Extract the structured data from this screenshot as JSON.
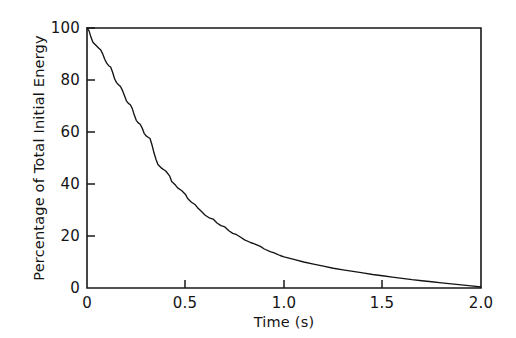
{
  "chart_data": {
    "type": "line",
    "title": "",
    "xlabel": "Time (s)",
    "ylabel": "Percentage of Total Initial Energy",
    "xlim": [
      0,
      2.0
    ],
    "ylim": [
      0,
      100
    ],
    "xticks": [
      "0",
      "0.5",
      "1.0",
      "1.5",
      "2.0"
    ],
    "xtick_values": [
      0,
      0.5,
      1.0,
      1.5,
      2.0
    ],
    "yticks": [
      "0",
      "20",
      "40",
      "60",
      "80",
      "100"
    ],
    "ytick_values": [
      0,
      20,
      40,
      60,
      80,
      100
    ],
    "grid": false,
    "legend": false,
    "legend_position": "none",
    "line_color": "#141414",
    "series": [
      {
        "name": "Percentage of total initial energy",
        "x": [
          0.0,
          0.01,
          0.02,
          0.03,
          0.05,
          0.06,
          0.07,
          0.08,
          0.09,
          0.1,
          0.11,
          0.12,
          0.13,
          0.14,
          0.15,
          0.16,
          0.17,
          0.18,
          0.19,
          0.2,
          0.21,
          0.22,
          0.23,
          0.24,
          0.25,
          0.26,
          0.27,
          0.28,
          0.29,
          0.3,
          0.31,
          0.32,
          0.33,
          0.34,
          0.35,
          0.36,
          0.38,
          0.39,
          0.4,
          0.42,
          0.43,
          0.45,
          0.46,
          0.48,
          0.5,
          0.51,
          0.53,
          0.55,
          0.56,
          0.58,
          0.6,
          0.62,
          0.64,
          0.66,
          0.68,
          0.7,
          0.72,
          0.74,
          0.76,
          0.78,
          0.8,
          0.83,
          0.85,
          0.88,
          0.9,
          0.93,
          0.95,
          0.98,
          1.0,
          1.05,
          1.1,
          1.15,
          1.2,
          1.25,
          1.3,
          1.35,
          1.4,
          1.45,
          1.5,
          1.55,
          1.6,
          1.65,
          1.7,
          1.75,
          1.8,
          1.85,
          1.9,
          1.95,
          2.0
        ],
        "y": [
          100.0,
          99.0,
          96.5,
          94.5,
          93.0,
          92.2,
          91.5,
          90.0,
          88.0,
          86.5,
          85.5,
          85.0,
          83.0,
          80.5,
          79.0,
          78.2,
          77.5,
          76.0,
          74.0,
          72.0,
          71.0,
          70.5,
          69.0,
          66.5,
          64.5,
          63.5,
          63.0,
          61.5,
          59.5,
          58.5,
          58.0,
          57.5,
          55.0,
          52.0,
          49.5,
          47.5,
          46.0,
          45.5,
          45.0,
          43.0,
          41.0,
          39.5,
          38.5,
          37.5,
          36.0,
          34.5,
          33.0,
          32.0,
          31.0,
          29.5,
          28.0,
          27.0,
          26.5,
          25.0,
          24.0,
          23.5,
          22.0,
          21.0,
          20.5,
          19.5,
          18.5,
          17.5,
          17.0,
          16.0,
          15.0,
          14.0,
          13.5,
          12.5,
          12.0,
          11.0,
          10.0,
          9.2,
          8.4,
          7.6,
          7.0,
          6.4,
          5.8,
          5.2,
          4.7,
          4.2,
          3.7,
          3.2,
          2.8,
          2.4,
          2.0,
          1.6,
          1.2,
          0.8,
          0.4
        ]
      }
    ]
  },
  "axes": {
    "y_title": "Percentage of Total Initial Energy",
    "x_title": "Time (s)"
  },
  "xtick_labels": {
    "t0": "0",
    "t1": "0.5",
    "t2": "1.0",
    "t3": "1.5",
    "t4": "2.0"
  },
  "ytick_labels": {
    "v0": "0",
    "v1": "20",
    "v2": "40",
    "v3": "60",
    "v4": "80",
    "v5": "100"
  }
}
